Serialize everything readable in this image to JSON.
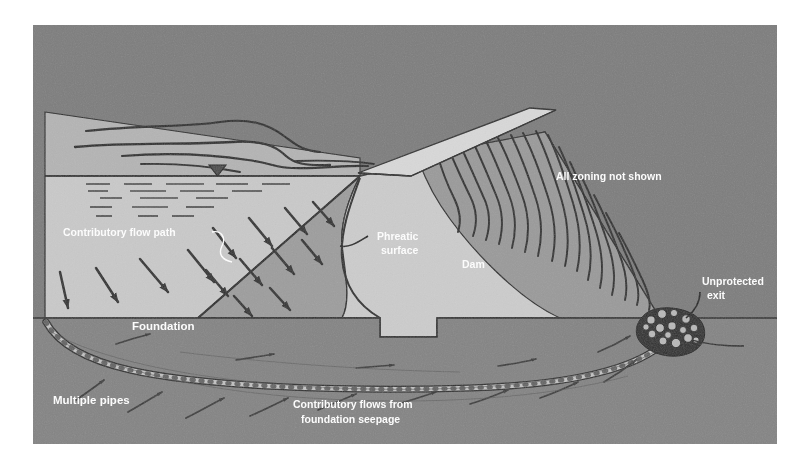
{
  "figure": {
    "frame": {
      "background_color": "#ffffff",
      "plate_color": "#7d7d7d",
      "plate_x": 33,
      "plate_y": 25,
      "plate_width": 744,
      "plate_height": 419
    }
  },
  "colors": {
    "sky_background": "#7d7d7d",
    "upper_terrain": "#b4b4b4",
    "reservoir_water": "#c9c9c9",
    "seepage_wedge": "#9d9d9d",
    "dam_body": "#cccccc",
    "dam_crest": "#d8d8d8",
    "downstream_slope": "#9a9a9a",
    "foundation": "#848484",
    "pipe_fill": "#c2c2c2",
    "line_dark": "#2b2b2b",
    "label_text": "#ffffff"
  },
  "labels": {
    "contributory_flow_path": "Contributory flow path",
    "phreatic_surface_line1": "Phreatic",
    "phreatic_surface_line2": "surface",
    "dam": "Dam",
    "all_zoning_not_shown": "All zoning not shown",
    "unprotected_exit_line1": "Unprotected",
    "unprotected_exit_line2": "exit",
    "foundation": "Foundation",
    "multiple_pipes": "Multiple pipes",
    "contributory_flows_line1": "Contributory flows from",
    "contributory_flows_line2": "foundation seepage"
  },
  "features": {
    "water_level_marker": "water-level-triangle",
    "water_hatch_rows": 5,
    "seepage_arrow_count": 14,
    "downstream_erosion_line_count": 16,
    "riprap_cluster": "unprotected-exit-rock-cluster",
    "pipe_path": "multiple-pipes-seepage-conduit"
  },
  "geometry": {
    "reservoir_surface_y": 175,
    "foundation_top_y": 318,
    "crest_left_x": 360,
    "crest_right_x": 545,
    "toe_x": 660
  }
}
